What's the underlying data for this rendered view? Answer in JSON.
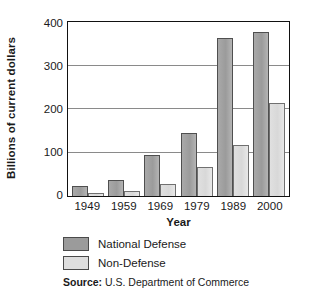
{
  "chart_data": {
    "type": "bar",
    "title": "",
    "xlabel": "Year",
    "ylabel": "Billions of current dollars",
    "categories": [
      "1949",
      "1959",
      "1969",
      "1979",
      "1989",
      "2000"
    ],
    "series": [
      {
        "name": "National Defense",
        "color": "#9b9b9b",
        "values": [
          23,
          38,
          95,
          147,
          365,
          380
        ]
      },
      {
        "name": "Non-Defense",
        "color": "#dedede",
        "values": [
          6,
          12,
          28,
          67,
          117,
          215
        ]
      }
    ],
    "ylim": [
      0,
      400
    ],
    "yticks": [
      "0",
      "100",
      "200",
      "300",
      "400"
    ],
    "ytick_values": [
      0,
      100,
      200,
      300,
      400
    ],
    "grid": "horizontal",
    "legend_position": "below-plot"
  },
  "source": {
    "prefix": "Source:",
    "text": "U.S. Department of Commerce"
  }
}
